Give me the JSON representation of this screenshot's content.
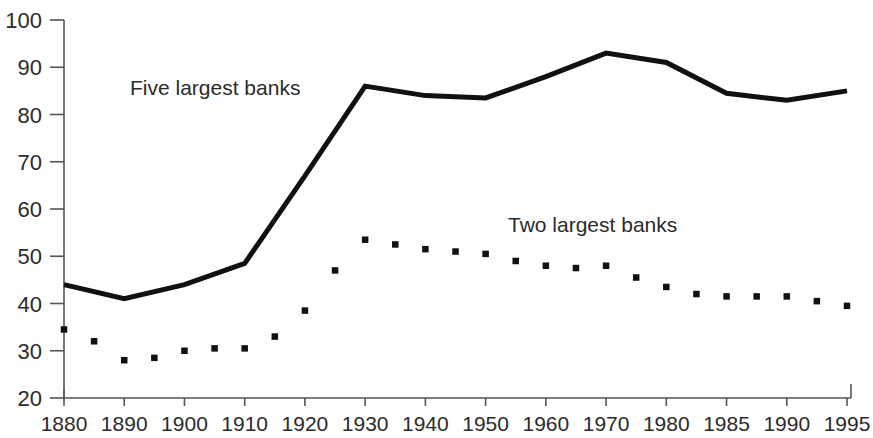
{
  "chart_data": {
    "type": "line",
    "title": "",
    "subtitle": "",
    "xlabel": "",
    "ylabel": "",
    "xlim": [
      0,
      13
    ],
    "ylim": [
      20,
      100
    ],
    "grid": false,
    "legend_position": "inline-annotations",
    "categories": [
      "1880",
      "1890",
      "1900",
      "1910",
      "1920",
      "1930",
      "1940",
      "1950",
      "1960",
      "1970",
      "1980",
      "1985",
      "1990",
      "1995"
    ],
    "x_tick_labels": [
      "1880",
      "1890",
      "1900",
      "1910",
      "1920",
      "1930",
      "1940",
      "1950",
      "1960",
      "1970",
      "1980",
      "1985",
      "1990",
      "1995"
    ],
    "y_tick_labels": [
      "20",
      "30",
      "40",
      "50",
      "60",
      "70",
      "80",
      "90",
      "100"
    ],
    "y_ticks": [
      20,
      30,
      40,
      50,
      60,
      70,
      80,
      90,
      100
    ],
    "series": [
      {
        "name": "Five largest banks",
        "style": "solid",
        "color": "#111111",
        "x": [
          "1880",
          "1890",
          "1900",
          "1910",
          "1920",
          "1930",
          "1940",
          "1950",
          "1960",
          "1970",
          "1980",
          "1985",
          "1990",
          "1995"
        ],
        "values": [
          44,
          41,
          44,
          48.5,
          67,
          86,
          84,
          83.5,
          88,
          93,
          91,
          84.5,
          83,
          85
        ]
      },
      {
        "name": "Two largest banks",
        "style": "dotted",
        "color": "#111111",
        "x": [
          "1880",
          "1885",
          "1890",
          "1895",
          "1900",
          "1905",
          "1910",
          "1915",
          "1920",
          "1925",
          "1930",
          "1935",
          "1940",
          "1945",
          "1950",
          "1955",
          "1960",
          "1965",
          "1970",
          "1975",
          "1980",
          "1982.5",
          "1985",
          "1987.5",
          "1990",
          "1992.5",
          "1995"
        ],
        "values": [
          34.5,
          32,
          28,
          28.5,
          30,
          30.5,
          30.5,
          33,
          38.5,
          47,
          53.5,
          52.5,
          51.5,
          51,
          50.5,
          49,
          48,
          47.5,
          48,
          45.5,
          43.5,
          42,
          41.5,
          41.5,
          41.5,
          40.5,
          39.5
        ]
      }
    ],
    "annotations": [
      {
        "text": "Five largest banks",
        "x_px": 130,
        "y_px": 95
      },
      {
        "text": "Two largest banks",
        "x_px": 508,
        "y_px": 232
      }
    ]
  },
  "colors": {
    "background": "#ffffff",
    "ink": "#111111",
    "axis": "#555555",
    "text": "#2b2b2b"
  }
}
